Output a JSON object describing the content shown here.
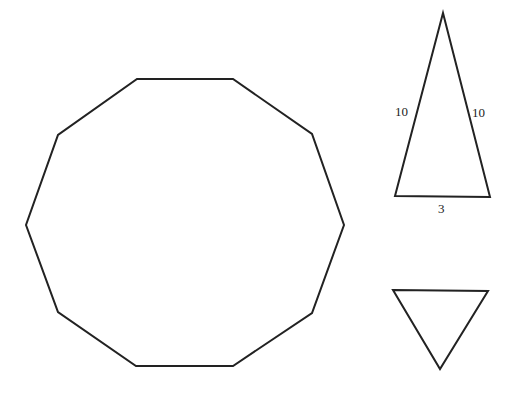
{
  "colors": {
    "stroke": "#222222",
    "background": "#ffffff"
  },
  "shapes": {
    "decagon": {
      "points": "137,79 233,79 312,134 344,225 312,313 233,366 136,366 58,312 26,225 58,135"
    },
    "isosceles_triangle": {
      "points": "443,13 490,197 395,196",
      "labels": {
        "left_side": "10",
        "right_side": "10",
        "base": "3"
      }
    },
    "inverted_triangle": {
      "points": "393,290 488,291 440,369"
    }
  }
}
